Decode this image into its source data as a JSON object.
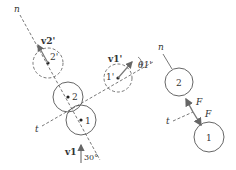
{
  "left_diagram": {
    "axis_n_label": "n",
    "axis_t_label": "t",
    "ball2_before_label": "2",
    "ball1_before_label": "1",
    "ball2_after_label": "2'",
    "ball1_after_label": "1'",
    "v2_after_label": "v2'",
    "v1_after_label": "v1'",
    "theta_label": "θ1'",
    "v1_label": "v1",
    "angle_label": "30°"
  },
  "right_diagram": {
    "axis_n_label": "n",
    "axis_t_label": "t",
    "ball2_label": "2",
    "ball1_label": "1",
    "force_up_label": "F",
    "force_down_label": "F"
  },
  "colors": {
    "stroke": "#555555",
    "arrow": "#777777"
  }
}
